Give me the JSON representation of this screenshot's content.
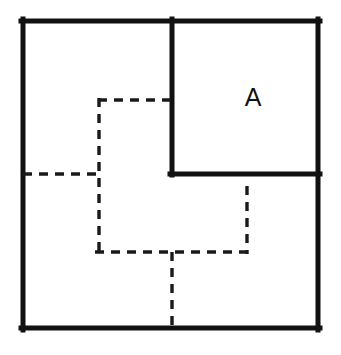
{
  "figure": {
    "background_color": "#ffffff",
    "solid_color": "#111111",
    "dashed_color": "#1a1a1a",
    "labels": [
      {
        "name": "region-a",
        "text": "A",
        "x": 253,
        "y": 99
      }
    ],
    "outer_square": {
      "name": "outer-square",
      "x": 21,
      "y": 19,
      "width": 299,
      "height": 311
    },
    "inner_square": {
      "name": "inner-square-a",
      "x": 172,
      "y": 19,
      "width": 148,
      "height": 156,
      "left_edge_x": 172,
      "bottom_edge_y": 175
    },
    "solid_segments": [
      {
        "name": "outer-top-edge",
        "x1": 21,
        "y1": 21,
        "x2": 320,
        "y2": 21
      },
      {
        "name": "outer-right-edge",
        "x1": 318,
        "y1": 19,
        "x2": 318,
        "y2": 330
      },
      {
        "name": "outer-bottom-edge",
        "x1": 320,
        "y1": 328,
        "x2": 21,
        "y2": 328
      },
      {
        "name": "outer-left-edge",
        "x1": 23,
        "y1": 330,
        "x2": 23,
        "y2": 19
      },
      {
        "name": "inner-square-left-edge",
        "x1": 172,
        "y1": 19,
        "x2": 172,
        "y2": 175
      },
      {
        "name": "inner-square-bottom-edge",
        "x1": 170,
        "y1": 174,
        "x2": 320,
        "y2": 174
      }
    ],
    "dashed_segments": [
      {
        "name": "dashed-upper-horizontal",
        "x1": 98,
        "y1": 100,
        "x2": 174,
        "y2": 100,
        "dash": "9 7"
      },
      {
        "name": "dashed-main-vertical",
        "x1": 99,
        "y1": 98,
        "x2": 99,
        "y2": 254,
        "dash": "9 7"
      },
      {
        "name": "dashed-left-horizontal",
        "x1": 23,
        "y1": 174,
        "x2": 100,
        "y2": 174,
        "dash": "9 7"
      },
      {
        "name": "dashed-lower-horizontal",
        "x1": 95,
        "y1": 252,
        "x2": 249,
        "y2": 252,
        "dash": "9 7"
      },
      {
        "name": "dashed-right-vertical",
        "x1": 247,
        "y1": 186,
        "x2": 247,
        "y2": 254,
        "dash": "9 7"
      },
      {
        "name": "dashed-bottom-vertical",
        "x1": 172,
        "y1": 252,
        "x2": 172,
        "y2": 329,
        "dash": "9 7"
      }
    ]
  }
}
